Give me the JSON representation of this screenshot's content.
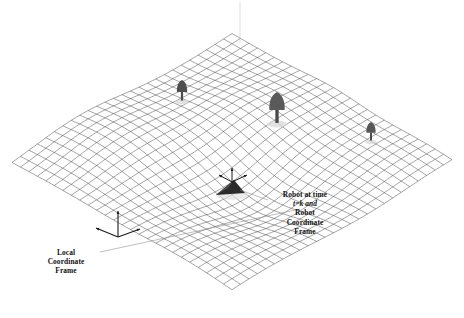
{
  "figure": {
    "background_color": "#ffffff",
    "width": 464,
    "height": 318
  },
  "annotations": {
    "robot_label": {
      "name": "robot-coordinate-frame-label",
      "lines": [
        "Robot at time",
        "t=k and",
        "Robot",
        "Coordinate",
        "Frame"
      ],
      "line1": "Robot at time",
      "line2": "t=k and",
      "line3": "Robot",
      "line4": "Coordinate",
      "line5": "Frame",
      "color": "#111111"
    },
    "local_label": {
      "name": "local-coordinate-frame-label",
      "lines": [
        "Local",
        "Coordinate",
        "Frame"
      ],
      "line1": "Local",
      "line2": "Coordinate",
      "line3": "Frame",
      "color": "#111111"
    }
  },
  "surface": {
    "type": "wireframe-mesh",
    "projection": "isometric",
    "grid_lines_u": 26,
    "grid_lines_v": 26,
    "line_color": "#4a4a4a",
    "line_width": 0.5,
    "corners": {
      "left": [
        12,
        163
      ],
      "top": [
        240,
        43
      ],
      "right": [
        452,
        163
      ],
      "bottom": [
        235,
        300
      ]
    },
    "bumps": [
      {
        "cx": -0.18,
        "cy": -0.3,
        "amp": 11,
        "sx": 0.26,
        "sy": 0.26
      },
      {
        "cx": 0.22,
        "cy": -0.16,
        "amp": 9,
        "sx": 0.22,
        "sy": 0.22
      },
      {
        "cx": 0.55,
        "cy": -0.02,
        "amp": 6,
        "sx": 0.18,
        "sy": 0.18
      },
      {
        "cx": -0.05,
        "cy": 0.16,
        "amp": -15,
        "sx": 0.22,
        "sy": 0.22
      },
      {
        "cx": -0.5,
        "cy": 0.3,
        "amp": 5,
        "sx": 0.25,
        "sy": 0.25
      },
      {
        "cx": 0.38,
        "cy": 0.36,
        "amp": 5,
        "sx": 0.22,
        "sy": 0.22
      }
    ]
  },
  "objects": {
    "robot": {
      "name": "robot-marker",
      "position": [
        232,
        192
      ],
      "color": "#2b2b2b",
      "has_coordinate_frame": true
    },
    "trees": [
      {
        "name": "tree-small-left",
        "position": [
          182,
          100
        ],
        "height": 20,
        "crown_color": "#4e4e4e"
      },
      {
        "name": "tree-large-center",
        "position": [
          277,
          122
        ],
        "height": 30,
        "crown_color": "#5a5a5a"
      },
      {
        "name": "tree-small-right",
        "position": [
          371,
          140
        ],
        "height": 18,
        "crown_color": "#575757"
      }
    ],
    "local_frame": {
      "name": "local-coordinate-frame-axes",
      "origin": [
        118,
        237
      ],
      "color": "#1a1a1a"
    }
  },
  "colors": {
    "mesh": "#4a4a4a",
    "text": "#111111",
    "object_dark": "#2b2b2b",
    "object_mid": "#5a5a5a",
    "leader_line": "#8a8a8a"
  }
}
